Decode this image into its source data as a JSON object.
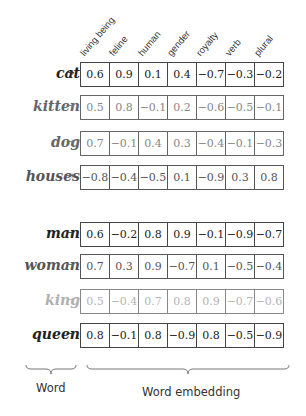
{
  "dimensions": [
    "living being",
    "feline",
    "human",
    "gender",
    "royalty",
    "verb",
    "plural"
  ],
  "arrow": "→",
  "rows": [
    {
      "word": "cat",
      "emphasis": "dark",
      "top": 62,
      "values": [
        "0.6",
        "0.9",
        "0.1",
        "0.4",
        "−0.7",
        "−0.3",
        "−0.2"
      ]
    },
    {
      "word": "kitten",
      "emphasis": "soft",
      "top": 95,
      "values": [
        "0.5",
        "0.8",
        "−0.1",
        "0.2",
        "−0.6",
        "−0.5",
        "−0.1"
      ]
    },
    {
      "word": "dog",
      "emphasis": "soft",
      "top": 131,
      "values": [
        "0.7",
        "−0.1",
        "0.4",
        "0.3",
        "−0.4",
        "−0.1",
        "−0.3"
      ]
    },
    {
      "word": "houses",
      "emphasis": "mid",
      "top": 165,
      "values": [
        "−0.8",
        "−0.4",
        "−0.5",
        "0.1",
        "−0.9",
        "0.3",
        "0.8"
      ]
    },
    {
      "word": "man",
      "emphasis": "dark",
      "top": 222,
      "values": [
        "0.6",
        "−0.2",
        "0.8",
        "0.9",
        "−0.1",
        "−0.9",
        "−0.7"
      ]
    },
    {
      "word": "woman",
      "emphasis": "mid",
      "top": 254,
      "values": [
        "0.7",
        "0.3",
        "0.9",
        "−0.7",
        "0.1",
        "−0.5",
        "−0.4"
      ]
    },
    {
      "word": "king",
      "emphasis": "light",
      "top": 289,
      "values": [
        "0.5",
        "−0.4",
        "0.7",
        "0.8",
        "0.9",
        "−0.7",
        "−0.6"
      ]
    },
    {
      "word": "queen",
      "emphasis": "dark",
      "top": 323,
      "values": [
        "0.8",
        "−0.1",
        "0.8",
        "−0.9",
        "0.8",
        "−0.5",
        "−0.9"
      ]
    }
  ],
  "footer": {
    "word_label": "Word",
    "embedding_label": "Word embedding"
  }
}
